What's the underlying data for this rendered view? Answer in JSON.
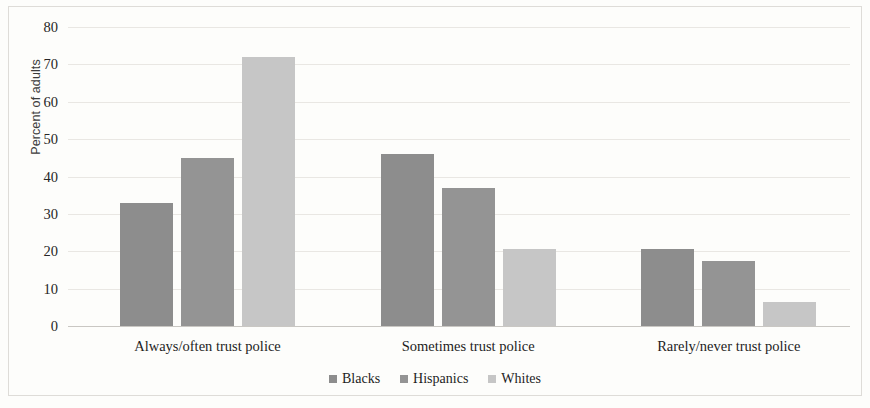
{
  "chart_data": {
    "type": "bar",
    "title": "",
    "xlabel": "",
    "ylabel": "Percent of adults",
    "ylim": [
      0,
      80
    ],
    "ytick_step": 10,
    "yticks": [
      "80",
      "70",
      "60",
      "50",
      "40",
      "30",
      "20",
      "10",
      "0"
    ],
    "grid": true,
    "legend_position": "bottom-center",
    "categories": [
      "Always/often trust police",
      "Sometimes trust police",
      "Rarely/never trust police"
    ],
    "series": [
      {
        "name": "Blacks",
        "color": "#8d8d8d",
        "values": [
          33,
          46,
          20.5
        ]
      },
      {
        "name": "Hispanics",
        "color": "#949494",
        "values": [
          45,
          37,
          17.5
        ]
      },
      {
        "name": "Whites",
        "color": "#c6c6c6",
        "values": [
          72,
          20.5,
          6.5
        ]
      }
    ]
  },
  "colors": {
    "background": "#fdfdfb",
    "gridline": "#e9e7e3",
    "baseline": "#c9c7c3",
    "text": "#1e1e1e",
    "frame": "#dedcd8"
  }
}
